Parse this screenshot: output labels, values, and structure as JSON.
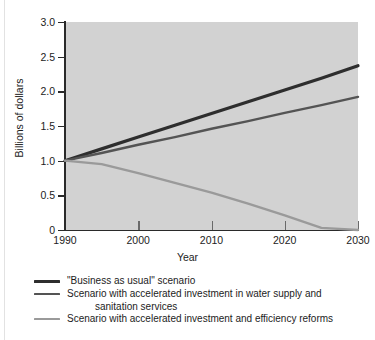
{
  "chart_data": {
    "type": "line",
    "title": "",
    "xlabel": "Year",
    "ylabel": "Billions of dollars",
    "xlim": [
      1990,
      2030
    ],
    "ylim": [
      0,
      3.0
    ],
    "grid": false,
    "legend_position": "below",
    "x_ticks": [
      "1990",
      "2000",
      "2010",
      "2020",
      "2030"
    ],
    "x_tick_values": [
      1990,
      2000,
      2010,
      2020,
      2030
    ],
    "y_ticks": [
      "0",
      "0.5",
      "1.0",
      "1.5",
      "2.0",
      "2.5",
      "3.0"
    ],
    "y_tick_values": [
      0,
      0.5,
      1.0,
      1.5,
      2.0,
      2.5,
      3.0
    ],
    "x": [
      1990,
      1995,
      2000,
      2005,
      2010,
      2015,
      2020,
      2025,
      2030
    ],
    "series": [
      {
        "name": "\"Business as usual\" scenario",
        "color": "#2e2e2e",
        "width": 3.2,
        "values": [
          1.0,
          1.17,
          1.34,
          1.51,
          1.68,
          1.85,
          2.02,
          2.19,
          2.37
        ]
      },
      {
        "name": "Scenario with accelerated investment in water supply and sanitation services",
        "name_line1": "Scenario with accelerated investment in water supply and",
        "name_line2": "sanitation services",
        "color": "#545454",
        "width": 2.4,
        "values": [
          1.0,
          1.11,
          1.23,
          1.34,
          1.46,
          1.57,
          1.69,
          1.8,
          1.92
        ]
      },
      {
        "name": "Scenario with accelerated investment and efficiency reforms",
        "color": "#9a9a9a",
        "width": 2.4,
        "values": [
          1.0,
          0.95,
          0.82,
          0.68,
          0.54,
          0.38,
          0.21,
          0.03,
          0.0
        ]
      }
    ]
  },
  "colors": {
    "plot_background": "#d2d2d2",
    "page_background": "#ffffff",
    "axis": "#2a2a2a",
    "text": "#1c1c1c"
  }
}
